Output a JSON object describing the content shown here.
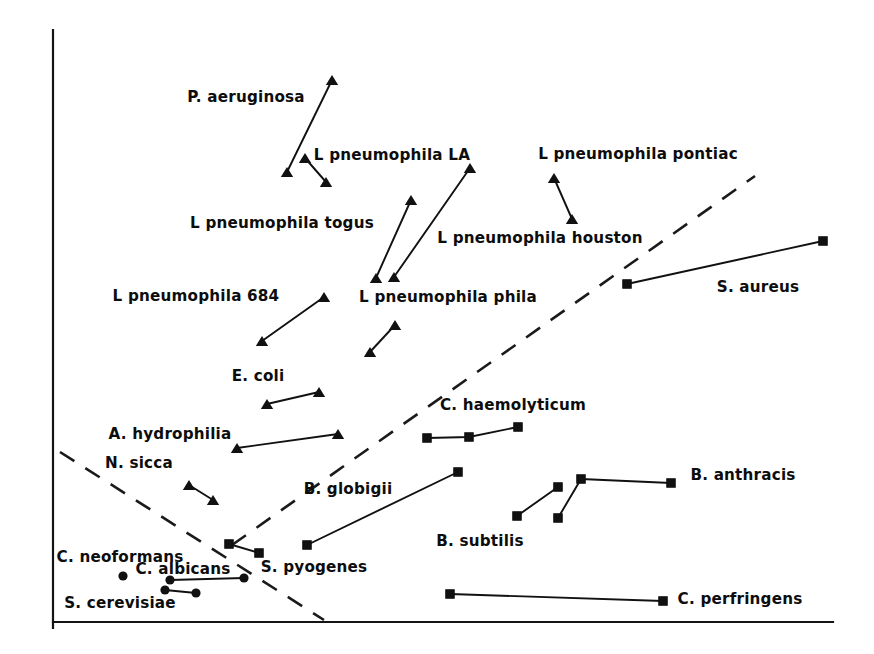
{
  "figure": {
    "type": "scatter-vector-plot",
    "background": "#ffffff",
    "ink_color": "#111111",
    "width": 874,
    "height": 654
  },
  "axes": {
    "x_axis": {
      "x1": 53,
      "y1": 622,
      "x2": 833,
      "y2": 622,
      "label": "",
      "ticks": []
    },
    "y_axis": {
      "x1": 53,
      "y1": 30,
      "x2": 53,
      "y2": 628,
      "label": "",
      "ticks": []
    }
  },
  "chart_data": {
    "type": "scatter",
    "title": "",
    "xlabel": "",
    "ylabel": "",
    "grid": false,
    "legend": "none",
    "xlim": [
      53,
      833
    ],
    "ylim": [
      30,
      622
    ],
    "note": "Each organism is drawn as a short connected trajectory of markers; marker shape encodes group (triangle, square, circle). Coordinates are in screenshot pixel space with y increasing downward.",
    "marker_shapes": [
      "triangle",
      "square",
      "circle"
    ],
    "boundaries": [
      {
        "name": "ascending-dashed-boundary",
        "style": "dashed",
        "points": [
          [
            232,
            545
          ],
          [
            755,
            176
          ]
        ]
      },
      {
        "name": "descending-dashed-boundary",
        "style": "dashed",
        "points": [
          [
            60,
            452
          ],
          [
            324,
            620
          ]
        ]
      }
    ],
    "series": [
      {
        "name": "P. aeruginosa",
        "marker": "triangle",
        "points": [
          [
            287,
            172
          ],
          [
            332,
            80
          ]
        ],
        "label": {
          "text": "P. aeruginosa",
          "x": 246,
          "y": 98
        }
      },
      {
        "name": "L pneumophila LA",
        "marker": "triangle",
        "points": [
          [
            305,
            158
          ],
          [
            326,
            182
          ]
        ],
        "label": {
          "text": "L pneumophila LA",
          "x": 392,
          "y": 156
        }
      },
      {
        "name": "L pneumophila togus",
        "marker": "triangle",
        "points": [
          [
            376,
            278
          ],
          [
            411,
            200
          ]
        ],
        "label": {
          "text": "L pneumophila togus",
          "x": 282,
          "y": 224
        }
      },
      {
        "name": "L pneumophila houston",
        "marker": "triangle",
        "points": [
          [
            394,
            277
          ],
          [
            470,
            168
          ]
        ],
        "label": {
          "text": "L pneumophila houston",
          "x": 540,
          "y": 239
        }
      },
      {
        "name": "L pneumophila pontiac",
        "marker": "triangle",
        "points": [
          [
            554,
            178
          ],
          [
            572,
            219
          ]
        ],
        "label": {
          "text": "L pneumophila pontiac",
          "x": 638,
          "y": 155
        }
      },
      {
        "name": "L pneumophila 684",
        "marker": "triangle",
        "points": [
          [
            262,
            341
          ],
          [
            324,
            297
          ]
        ],
        "label": {
          "text": "L pneumophila 684",
          "x": 196,
          "y": 297
        }
      },
      {
        "name": "L pneumophila phila",
        "marker": "triangle",
        "points": [
          [
            370,
            352
          ],
          [
            395,
            325
          ]
        ],
        "label": {
          "text": "L pneumophila phila",
          "x": 448,
          "y": 298
        }
      },
      {
        "name": "E. coli",
        "marker": "triangle",
        "points": [
          [
            267,
            404
          ],
          [
            319,
            392
          ]
        ],
        "label": {
          "text": "E. coli",
          "x": 258,
          "y": 377
        }
      },
      {
        "name": "A. hydrophilia",
        "marker": "triangle",
        "points": [
          [
            237,
            448
          ],
          [
            338,
            434
          ]
        ],
        "label": {
          "text": "A. hydrophilia",
          "x": 170,
          "y": 435
        }
      },
      {
        "name": "N. sicca",
        "marker": "triangle",
        "points": [
          [
            189,
            485
          ],
          [
            213,
            500
          ]
        ],
        "label": {
          "text": "N. sicca",
          "x": 139,
          "y": 464
        }
      },
      {
        "name": "C. haemolyticum",
        "marker": "square",
        "points": [
          [
            427,
            438
          ],
          [
            469,
            437
          ],
          [
            518,
            427
          ]
        ],
        "label": {
          "text": "C. haemolyticum",
          "x": 513,
          "y": 406
        }
      },
      {
        "name": "S. aureus",
        "marker": "square",
        "points": [
          [
            627,
            284
          ],
          [
            823,
            241
          ]
        ],
        "label": {
          "text": "S. aureus",
          "x": 758,
          "y": 288
        }
      },
      {
        "name": "B. globigii",
        "marker": "square",
        "points": [
          [
            307,
            545
          ],
          [
            458,
            472
          ]
        ],
        "label": {
          "text": "B. globigii",
          "x": 348,
          "y": 490
        }
      },
      {
        "name": "B. subtilis",
        "marker": "square",
        "points": [
          [
            517,
            516
          ],
          [
            558,
            487
          ]
        ],
        "label": {
          "text": "B. subtilis",
          "x": 480,
          "y": 542
        }
      },
      {
        "name": "B. anthracis",
        "marker": "square",
        "points": [
          [
            558,
            518
          ],
          [
            581,
            479
          ],
          [
            671,
            483
          ]
        ],
        "label": {
          "text": "B. anthracis",
          "x": 743,
          "y": 476
        }
      },
      {
        "name": "C. perfringens",
        "marker": "square",
        "points": [
          [
            450,
            594
          ],
          [
            663,
            601
          ]
        ],
        "label": {
          "text": "C. perfringens",
          "x": 740,
          "y": 600
        }
      },
      {
        "name": "S. pyogenes",
        "marker": "square",
        "points": [
          [
            229,
            544
          ],
          [
            259,
            553
          ]
        ],
        "label": {
          "text": "S. pyogenes",
          "x": 314,
          "y": 568
        }
      },
      {
        "name": "C. neoformans",
        "marker": "circle",
        "points": [
          [
            123,
            576
          ]
        ],
        "label": {
          "text": "C. neoformans",
          "x": 120,
          "y": 558
        }
      },
      {
        "name": "C. albicans",
        "marker": "circle",
        "points": [
          [
            170,
            580
          ],
          [
            244,
            578
          ]
        ],
        "label": {
          "text": "C. albicans",
          "x": 183,
          "y": 570
        }
      },
      {
        "name": "S. cerevisiae",
        "marker": "circle",
        "points": [
          [
            165,
            590
          ],
          [
            196,
            593
          ]
        ],
        "label": {
          "text": "S. cerevisiae",
          "x": 120,
          "y": 604
        }
      }
    ]
  }
}
